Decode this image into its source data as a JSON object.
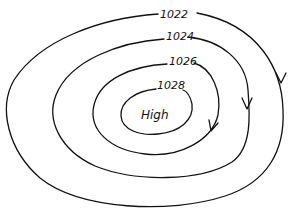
{
  "diagram": {
    "type": "isobar-map",
    "center": {
      "label": "High"
    },
    "isobars": [
      {
        "value": "1022",
        "label": "1022",
        "has_arrow": true
      },
      {
        "value": "1024",
        "label": "1024",
        "has_arrow": true
      },
      {
        "value": "1026",
        "label": "1026",
        "has_arrow": true
      },
      {
        "value": "1028",
        "label": "1028",
        "has_arrow": false
      }
    ],
    "flow_direction": "clockwise",
    "colors": {
      "line": "#111111",
      "background": "#ffffff"
    }
  }
}
